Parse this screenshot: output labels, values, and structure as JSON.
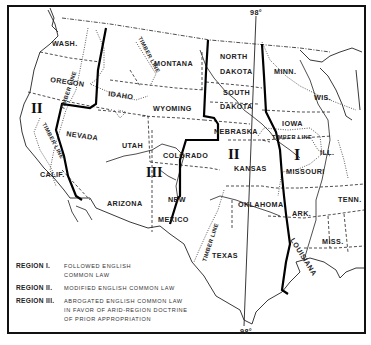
{
  "map": {
    "meridian_label_top": "98°",
    "meridian_label_bottom": "98°",
    "states": {
      "wash": "WASH.",
      "oregon": "OREGON",
      "calif": "CALIF.",
      "idaho": "IDAHO",
      "nevada": "NEVADA",
      "montana": "MONTANA",
      "wyoming": "WYOMING",
      "utah": "UTAH",
      "colorado": "COLORADO",
      "arizona": "ARIZONA",
      "new": "NEW",
      "mexico": "MEXICO",
      "north": "NORTH",
      "dakota_n": "DAKOTA",
      "south": "SOUTH",
      "dakota_s": "DAKOTA",
      "nebraska": "NEBRASKA",
      "kansas": "KANSAS",
      "oklahoma": "OKLAHOMA",
      "texas": "TEXAS",
      "minn": "MINN.",
      "wis": "WIS.",
      "iowa": "IOWA",
      "ill": "ILL.",
      "missouri": "MISSOURI",
      "ark": "ARK.",
      "tenn": "TENN.",
      "miss": "MISS.",
      "louisiana": "LOUISIANA"
    },
    "timber_line_label": "TIMBER LINE",
    "region_markers": {
      "west_coast": "II",
      "plains": "II",
      "mountain": "III",
      "east": "I"
    }
  },
  "legend": {
    "items": [
      {
        "key": "REGION I.",
        "lines": [
          "FOLLOWED ENGLISH",
          "COMMON LAW"
        ]
      },
      {
        "key": "REGION II.",
        "lines": [
          "MODIFIED ENGLISH COMMON LAW"
        ]
      },
      {
        "key": "REGION III.",
        "lines": [
          "ABROGATED ENGLISH COMMON LAW",
          "IN FAVOR OF ARID-REGION DOCTRINE",
          "OF PRIOR APPROPRIATION"
        ]
      }
    ]
  }
}
